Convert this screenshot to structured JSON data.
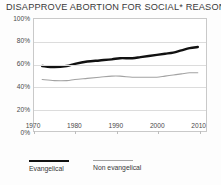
{
  "chart_data": {
    "type": "line",
    "title": "DISAPPROVE ABORTION FOR SOCIAL* REASONS",
    "xlabel": "",
    "ylabel": "",
    "xlim": [
      1970,
      2012
    ],
    "ylim": [
      0,
      100
    ],
    "grid": true,
    "legend_position": "bottom-left",
    "y_ticks": [
      "0%",
      "20%",
      "40%",
      "60%",
      "80%",
      "100%"
    ],
    "y_tick_values": [
      0,
      20,
      40,
      60,
      80,
      100
    ],
    "x_ticks": [
      "1970",
      "1980",
      "1990",
      "2000",
      "2010"
    ],
    "x_tick_values": [
      1970,
      1980,
      1990,
      2000,
      2010
    ],
    "x": [
      1972,
      1975,
      1978,
      1980,
      1983,
      1986,
      1989,
      1991,
      1994,
      1996,
      1998,
      2000,
      2002,
      2004,
      2006,
      2008,
      2010
    ],
    "series": [
      {
        "name": "Evangelical",
        "color": "#111111",
        "width": 2.4,
        "values": [
          58,
          57,
          58,
          60,
          62,
          63,
          64,
          65,
          65,
          66,
          67,
          68,
          69,
          70,
          72,
          74,
          75
        ]
      },
      {
        "name": "Non evangelical",
        "color": "#a3a3a3",
        "width": 1.1,
        "values": [
          46,
          45,
          45,
          46,
          47,
          48,
          49,
          49,
          48,
          48,
          48,
          48,
          49,
          50,
          51,
          52,
          52
        ]
      }
    ]
  },
  "legend": {
    "items": [
      {
        "label": "Evangelical",
        "style": "thick"
      },
      {
        "label": "Non evangelical",
        "style": "thin"
      }
    ]
  }
}
